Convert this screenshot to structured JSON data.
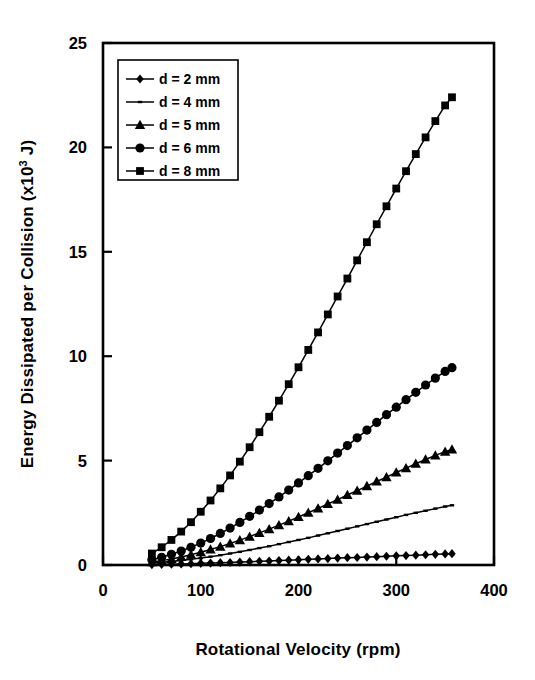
{
  "chart_data": {
    "type": "line",
    "title": "",
    "xlabel": "Rotational Velocity (rpm)",
    "ylabel_main": "Energy Dissipated per Collision (x10",
    "ylabel_sup": "3",
    "ylabel_tail": " J)",
    "ylabel_full": "Energy Dissipated per Collision (x10^3 J)",
    "xlim": [
      0,
      400
    ],
    "ylim": [
      0,
      25
    ],
    "xticks": [
      0,
      100,
      200,
      300,
      400
    ],
    "yticks": [
      0,
      5,
      10,
      15,
      20,
      25
    ],
    "xtick_labels": [
      "0",
      "100",
      "200",
      "300",
      "400"
    ],
    "ytick_labels": [
      "0",
      "5",
      "10",
      "15",
      "20",
      "25"
    ],
    "grid": false,
    "legend_position": "upper-left-inside",
    "x": [
      50,
      60,
      70,
      80,
      90,
      100,
      110,
      120,
      130,
      140,
      150,
      160,
      170,
      180,
      190,
      200,
      210,
      220,
      230,
      240,
      250,
      260,
      270,
      280,
      290,
      300,
      310,
      320,
      330,
      340,
      350,
      357
    ],
    "series": [
      {
        "name": "d = 2 mm",
        "marker": "diamond",
        "values": [
          0.02,
          0.03,
          0.04,
          0.05,
          0.06,
          0.08,
          0.09,
          0.11,
          0.12,
          0.14,
          0.16,
          0.18,
          0.19,
          0.21,
          0.23,
          0.25,
          0.27,
          0.29,
          0.31,
          0.33,
          0.35,
          0.36,
          0.38,
          0.4,
          0.42,
          0.44,
          0.45,
          0.47,
          0.49,
          0.51,
          0.53,
          0.54
        ]
      },
      {
        "name": "d = 4 mm",
        "marker": "dash",
        "values": [
          0.09,
          0.13,
          0.17,
          0.22,
          0.27,
          0.33,
          0.4,
          0.47,
          0.55,
          0.63,
          0.72,
          0.81,
          0.9,
          1.0,
          1.1,
          1.2,
          1.3,
          1.41,
          1.52,
          1.63,
          1.74,
          1.85,
          1.96,
          2.07,
          2.18,
          2.29,
          2.4,
          2.5,
          2.6,
          2.7,
          2.8,
          2.86
        ]
      },
      {
        "name": "d = 5 mm",
        "marker": "triangle",
        "values": [
          0.14,
          0.21,
          0.29,
          0.38,
          0.49,
          0.61,
          0.74,
          0.88,
          1.03,
          1.19,
          1.36,
          1.54,
          1.72,
          1.91,
          2.1,
          2.3,
          2.5,
          2.71,
          2.92,
          3.13,
          3.35,
          3.56,
          3.78,
          4.0,
          4.21,
          4.43,
          4.64,
          4.85,
          5.05,
          5.25,
          5.43,
          5.53
        ]
      },
      {
        "name": "d = 6 mm",
        "marker": "circle",
        "values": [
          0.25,
          0.37,
          0.51,
          0.67,
          0.85,
          1.05,
          1.27,
          1.51,
          1.77,
          2.04,
          2.33,
          2.63,
          2.94,
          3.26,
          3.59,
          3.93,
          4.28,
          4.63,
          4.99,
          5.36,
          5.72,
          6.09,
          6.46,
          6.83,
          7.2,
          7.56,
          7.92,
          8.27,
          8.62,
          8.95,
          9.27,
          9.45
        ]
      },
      {
        "name": "d = 8 mm",
        "marker": "square",
        "values": [
          0.55,
          0.85,
          1.2,
          1.6,
          2.05,
          2.55,
          3.09,
          3.67,
          4.29,
          4.95,
          5.64,
          6.36,
          7.1,
          7.87,
          8.66,
          9.47,
          10.3,
          11.14,
          12.0,
          12.86,
          13.72,
          14.59,
          15.46,
          16.32,
          17.18,
          18.03,
          18.86,
          19.68,
          20.48,
          21.26,
          22.01,
          22.4
        ]
      }
    ],
    "colors": {
      "line": "#000000",
      "marker": "#000000",
      "frame": "#000000",
      "background": "#ffffff"
    }
  },
  "legend": {
    "items": [
      {
        "label": "d = 2 mm",
        "marker": "diamond"
      },
      {
        "label": "d = 4 mm",
        "marker": "dash"
      },
      {
        "label": "d = 5 mm",
        "marker": "triangle"
      },
      {
        "label": "d = 6 mm",
        "marker": "circle"
      },
      {
        "label": "d = 8 mm",
        "marker": "square"
      }
    ]
  }
}
